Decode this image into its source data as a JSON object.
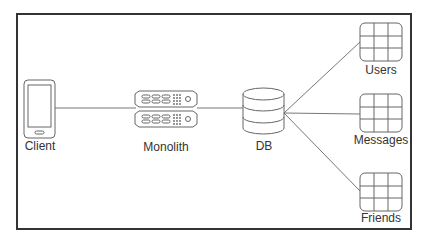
{
  "diagram": {
    "title": "",
    "nodes": [
      {
        "id": "client",
        "label": "Client",
        "icon": "mobile-phone-icon"
      },
      {
        "id": "monolith",
        "label": "Monolith",
        "icon": "server-rack-icon"
      },
      {
        "id": "db",
        "label": "DB",
        "icon": "database-icon"
      },
      {
        "id": "users",
        "label": "Users",
        "icon": "table-grid-icon"
      },
      {
        "id": "messages",
        "label": "Messages",
        "icon": "table-grid-icon"
      },
      {
        "id": "friends",
        "label": "Friends",
        "icon": "table-grid-icon"
      }
    ],
    "edges": [
      {
        "from": "client",
        "to": "monolith"
      },
      {
        "from": "monolith",
        "to": "db"
      },
      {
        "from": "db",
        "to": "users"
      },
      {
        "from": "db",
        "to": "messages"
      },
      {
        "from": "db",
        "to": "friends"
      }
    ],
    "colors": {
      "stroke": "#555555",
      "frame": "#333333",
      "text": "#333333",
      "background": "#ffffff"
    }
  }
}
